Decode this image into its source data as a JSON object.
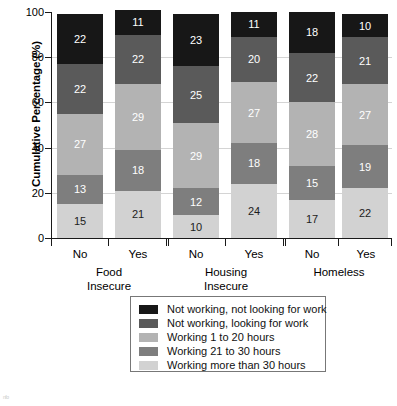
{
  "chart_data": {
    "type": "bar",
    "subtype": "stacked-percentage",
    "title": "",
    "xlabel": "",
    "ylabel": "Cumulative Percentage (%)",
    "ylim": [
      0,
      100
    ],
    "yticks": [
      0,
      20,
      40,
      60,
      80,
      100
    ],
    "grid": true,
    "legend_position": "bottom-center",
    "groups": [
      {
        "name": "Food Insecure",
        "categories": [
          "No",
          "Yes"
        ]
      },
      {
        "name": "Housing Insecure",
        "categories": [
          "No",
          "Yes"
        ]
      },
      {
        "name": "Homeless",
        "categories": [
          "No",
          "Yes"
        ]
      }
    ],
    "categories": [
      "Food Insecure - No",
      "Food Insecure - Yes",
      "Housing Insecure - No",
      "Housing Insecure - Yes",
      "Homeless - No",
      "Homeless - Yes"
    ],
    "series": [
      {
        "name": "Working more than 30 hours",
        "color": "#d2d2d2",
        "values": [
          15,
          21,
          10,
          24,
          17,
          22
        ]
      },
      {
        "name": "Working 21 to 30 hours",
        "color": "#7e7e7e",
        "values": [
          13,
          18,
          12,
          18,
          15,
          19
        ]
      },
      {
        "name": "Working 1 to 20 hours",
        "color": "#b3b3b3",
        "values": [
          27,
          29,
          29,
          27,
          28,
          27
        ]
      },
      {
        "name": "Not working, looking for work",
        "color": "#5a5a5a",
        "values": [
          22,
          22,
          25,
          20,
          22,
          21
        ]
      },
      {
        "name": "Not working, not looking for work",
        "color": "#171717",
        "values": [
          22,
          11,
          23,
          11,
          18,
          10
        ]
      }
    ],
    "stack_order_top_to_bottom": [
      "Not working, not looking for work",
      "Not working, looking for work",
      "Working 1 to 20 hours",
      "Working 21 to 30 hours",
      "Working more than 30 hours"
    ]
  },
  "axis": {
    "y_title": "Cumulative Percentage (%)",
    "y_ticks": [
      "0",
      "20",
      "40",
      "60",
      "80",
      "100"
    ]
  },
  "x_labels": {
    "g1_no": "No",
    "g1_yes": "Yes",
    "g1_line1": "Food",
    "g1_line2": "Insecure",
    "g2_no": "No",
    "g2_yes": "Yes",
    "g2_line1": "Housing",
    "g2_line2": "Insecure",
    "g3_no": "No",
    "g3_yes": "Yes",
    "g3_line1": "Homeless",
    "g3_line2": ""
  },
  "legend": {
    "items": [
      {
        "label": "Not working, not looking for work",
        "color": "#171717"
      },
      {
        "label": "Not working, looking for work",
        "color": "#5a5a5a"
      },
      {
        "label": "Working 1 to 20 hours",
        "color": "#b3b3b3"
      },
      {
        "label": "Working 21 to 30 hours",
        "color": "#7e7e7e"
      },
      {
        "label": "Working more than 30 hours",
        "color": "#d2d2d2"
      }
    ]
  },
  "bar_labels": {
    "b0": [
      "22",
      "22",
      "27",
      "13",
      "15"
    ],
    "b1": [
      "11",
      "22",
      "29",
      "18",
      "21"
    ],
    "b2": [
      "23",
      "25",
      "29",
      "12",
      "10"
    ],
    "b3": [
      "11",
      "20",
      "27",
      "18",
      "24"
    ],
    "b4": [
      "18",
      "22",
      "28",
      "15",
      "17"
    ],
    "b5": [
      "10",
      "21",
      "27",
      "19",
      "22"
    ]
  },
  "artifact": {
    "text": "nfo"
  }
}
